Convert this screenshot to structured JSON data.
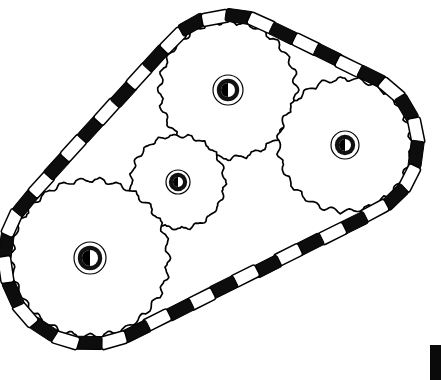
{
  "figure": {
    "kind": "line-art-scan",
    "width": 441,
    "height": 380,
    "background_color": "#ffffff",
    "ink_color": "#000000",
    "description": "Black and white scanned technical illustration of four toothed sprocket wheels linked by a roller chain with alternating dark and light link plates."
  },
  "palette": {
    "ink": "#000000",
    "paper": "#ffffff",
    "link_dark": "#0d0d0d",
    "link_light": "#ffffff",
    "hub_ring": "#111111",
    "artifact": "#0a0a0a"
  },
  "sprockets": [
    {
      "id": "sprocket-top",
      "label": "Top sprocket",
      "center_x": 228,
      "center_y": 90,
      "body_radius": 66,
      "tooth_radius": 76,
      "tooth_count": 24,
      "hub_outer_radius": 15,
      "hub_inner_radius": 9,
      "bore_radius": 7
    },
    {
      "id": "sprocket-right",
      "label": "Right sprocket",
      "center_x": 345,
      "center_y": 145,
      "body_radius": 64,
      "tooth_radius": 74,
      "tooth_count": 23,
      "hub_outer_radius": 14,
      "hub_inner_radius": 8,
      "bore_radius": 6
    },
    {
      "id": "sprocket-middle",
      "label": "Middle small sprocket",
      "center_x": 178,
      "center_y": 182,
      "body_radius": 45,
      "tooth_radius": 53,
      "tooth_count": 19,
      "hub_outer_radius": 12,
      "hub_inner_radius": 7,
      "bore_radius": 5
    },
    {
      "id": "sprocket-bottom-left",
      "label": "Bottom left sprocket",
      "center_x": 90,
      "center_y": 258,
      "body_radius": 76,
      "tooth_radius": 87,
      "tooth_count": 26,
      "hub_outer_radius": 16,
      "hub_inner_radius": 10,
      "bore_radius": 8
    }
  ],
  "chain": {
    "label": "Roller chain",
    "link_count": 46,
    "link_length": 17,
    "link_width": 13,
    "pattern": "alternating dark and light plates"
  },
  "artifact": {
    "label": "Scan edge bar",
    "x": 430,
    "y": 345,
    "width": 11,
    "height": 35,
    "color": "#0a0a0a"
  }
}
